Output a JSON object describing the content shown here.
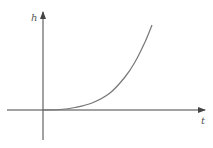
{
  "chart_data": {
    "type": "line",
    "title": "",
    "xlabel": "t",
    "ylabel": "h",
    "grid": false,
    "legend": null,
    "series": [
      {
        "name": "h(t)",
        "color": "#777777",
        "points_px": [
          [
            43,
            110
          ],
          [
            60,
            109.5
          ],
          [
            75,
            107.5
          ],
          [
            92,
            103
          ],
          [
            110,
            93
          ],
          [
            125,
            77
          ],
          [
            135,
            62
          ],
          [
            145,
            42
          ],
          [
            152,
            25
          ]
        ]
      }
    ],
    "ticks": {
      "x": [],
      "y": []
    }
  },
  "colors": {
    "axis": "#444444",
    "curve": "#777777",
    "label": "#555555"
  },
  "labels": {
    "x_axis": "t",
    "y_axis": "h"
  }
}
